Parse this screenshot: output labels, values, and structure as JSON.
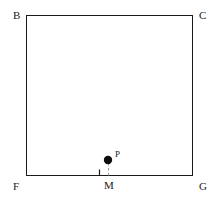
{
  "figure": {
    "background_color": "#ffffff",
    "stroke_color": "#1a1a1a",
    "dash_color": "#9a9a9a",
    "width": 218,
    "height": 203
  },
  "rectangle": {
    "name": "BCGF",
    "left": 26,
    "top": 15,
    "right": 193,
    "bottom": 176,
    "stroke_width": 1
  },
  "vertices": [
    {
      "id": "B",
      "label": "B",
      "corner": "top-left",
      "x": 26,
      "y": 15,
      "label_x": 13,
      "label_y": 10
    },
    {
      "id": "C",
      "label": "C",
      "corner": "top-right",
      "x": 193,
      "y": 15,
      "label_x": 199,
      "label_y": 10
    },
    {
      "id": "F",
      "label": "F",
      "corner": "bottom-left",
      "x": 26,
      "y": 176,
      "label_x": 13,
      "label_y": 181
    },
    {
      "id": "G",
      "label": "G",
      "corner": "bottom-right",
      "x": 193,
      "y": 176,
      "label_x": 199,
      "label_y": 181
    }
  ],
  "points": [
    {
      "id": "P",
      "label": "P",
      "type": "filled-dot",
      "x": 108,
      "y": 160,
      "radius": 4,
      "label_x": 115,
      "label_y": 150
    },
    {
      "id": "M",
      "label": "M",
      "type": "foot-of-perpendicular",
      "x": 108,
      "y": 176,
      "label_x": 104,
      "label_y": 180
    }
  ],
  "segments": [
    {
      "id": "PM",
      "from": "P",
      "to": "M",
      "style": "dashed",
      "x1": 108,
      "y1": 160,
      "x2": 108,
      "y2": 176
    }
  ],
  "right_angle_marker": {
    "at": "M",
    "between": [
      "MP",
      "MF"
    ],
    "size": 7,
    "x": 99,
    "y": 169
  }
}
